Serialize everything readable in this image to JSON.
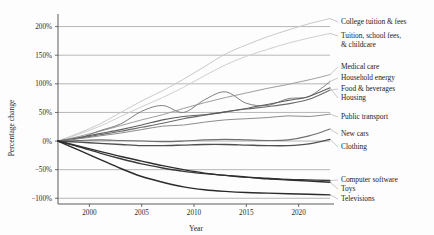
{
  "chart_data": {
    "type": "line",
    "title": "",
    "xlabel": "Year",
    "ylabel": "Percentage change",
    "xlim": [
      1997,
      2023
    ],
    "ylim": [
      -110,
      215
    ],
    "grid": true,
    "legend_position": "right-inline-labels",
    "xticks": [
      2000,
      2005,
      2010,
      2015,
      2020
    ],
    "xtick_labels": [
      "2000",
      "2005",
      "2010",
      "2015",
      "2020"
    ],
    "yticks": [
      -100,
      -50,
      0,
      50,
      100,
      150,
      200
    ],
    "ytick_labels": [
      "−100%",
      "−50%",
      "0%",
      "50%",
      "100%",
      "150%",
      "200%"
    ],
    "x": [
      1997,
      1999,
      2001,
      2003,
      2005,
      2007,
      2009,
      2011,
      2013,
      2015,
      2017,
      2019,
      2021,
      2023
    ],
    "series": [
      {
        "name": "College tuition & fees",
        "color": "#c9c9c9",
        "width": 1.0,
        "values": [
          0,
          14,
          30,
          50,
          70,
          88,
          108,
          130,
          152,
          168,
          182,
          194,
          205,
          214
        ]
      },
      {
        "name": "Tuition, school fees, & childcare",
        "color": "#cfcfcf",
        "width": 1.0,
        "values": [
          0,
          12,
          26,
          43,
          60,
          76,
          94,
          114,
          133,
          148,
          160,
          171,
          180,
          188
        ]
      },
      {
        "name": "Medical care",
        "color": "#9e9e9e",
        "width": 1.0,
        "values": [
          0,
          8,
          17,
          27,
          37,
          46,
          57,
          67,
          76,
          84,
          92,
          99,
          107,
          116
        ]
      },
      {
        "name": "Household energy",
        "color": "#7e7e7e",
        "width": 1.0,
        "values": [
          0,
          5,
          18,
          30,
          52,
          62,
          50,
          72,
          86,
          66,
          62,
          74,
          78,
          104
        ]
      },
      {
        "name": "Food & beverages",
        "color": "#6b6b6b",
        "width": 1.1,
        "values": [
          0,
          5,
          11,
          17,
          24,
          31,
          39,
          45,
          51,
          56,
          60,
          65,
          73,
          89
        ]
      },
      {
        "name": "Housing",
        "color": "#5d5d5d",
        "width": 1.1,
        "values": [
          0,
          6,
          13,
          20,
          28,
          37,
          43,
          46,
          51,
          57,
          64,
          71,
          78,
          93
        ]
      },
      {
        "name": "Public transport",
        "color": "#8c8c8c",
        "width": 1.0,
        "values": [
          0,
          4,
          9,
          14,
          20,
          26,
          28,
          33,
          37,
          39,
          41,
          44,
          43,
          47
        ]
      },
      {
        "name": "New cars",
        "color": "#6f6f6f",
        "width": 1.1,
        "values": [
          0,
          1,
          2,
          1,
          0,
          -1,
          0,
          2,
          3,
          2,
          1,
          2,
          9,
          21
        ]
      },
      {
        "name": "Clothing",
        "color": "#4f4f4f",
        "width": 1.3,
        "values": [
          0,
          -2,
          -4,
          -6,
          -8,
          -8,
          -7,
          -6,
          -6,
          -7,
          -8,
          -8,
          -5,
          3
        ]
      },
      {
        "name": "Computer software",
        "color": "#3a3a3a",
        "width": 1.4,
        "values": [
          0,
          -10,
          -21,
          -31,
          -40,
          -47,
          -53,
          -57,
          -60,
          -63,
          -65,
          -67,
          -68,
          -69
        ]
      },
      {
        "name": "Toys",
        "color": "#2e2e2e",
        "width": 1.4,
        "values": [
          0,
          -9,
          -18,
          -27,
          -35,
          -43,
          -50,
          -56,
          -60,
          -63,
          -66,
          -68,
          -70,
          -72
        ]
      },
      {
        "name": "Televisions",
        "color": "#2a2a2a",
        "width": 1.4,
        "values": [
          0,
          -16,
          -32,
          -48,
          -62,
          -72,
          -80,
          -85,
          -88,
          -90,
          -91,
          -92,
          -93,
          -94
        ]
      }
    ],
    "annotations": [
      {
        "text": "College tuition & fees",
        "y_at_label": 212
      },
      {
        "text": "Tuition, school fees,",
        "y_at_label": 186
      },
      {
        "text": "& childcare",
        "y_at_label": 170
      },
      {
        "text": "Medical care",
        "y_at_label": 116
      },
      {
        "text": "Household energy",
        "y_at_label": 101
      },
      {
        "text": "Food & beverages",
        "y_at_label": 88
      },
      {
        "text": "Housing",
        "y_at_label": 74
      },
      {
        "text": "Public transport",
        "y_at_label": 47
      },
      {
        "text": "New cars",
        "y_at_label": 21
      },
      {
        "text": "Clothing",
        "y_at_label": 3
      },
      {
        "text": "Computer software",
        "y_at_label": -69
      },
      {
        "text": "Toys",
        "y_at_label": -79
      },
      {
        "text": "Televisions",
        "y_at_label": -94
      }
    ]
  },
  "labels": {
    "y_axis_title": "Percentage change",
    "x_axis_title": "Year",
    "right_labels": [
      {
        "id": "college-tuition",
        "text": "College tuition & fees"
      },
      {
        "id": "tuition-school-fees",
        "text": "Tuition, school fees,"
      },
      {
        "id": "tuition-childcare",
        "text": "& childcare"
      },
      {
        "id": "medical-care",
        "text": "Medical care"
      },
      {
        "id": "household-energy",
        "text": "Household energy"
      },
      {
        "id": "food-beverages",
        "text": "Food & beverages"
      },
      {
        "id": "housing",
        "text": "Housing"
      },
      {
        "id": "public-transport",
        "text": "Public transport"
      },
      {
        "id": "new-cars",
        "text": "New cars"
      },
      {
        "id": "clothing",
        "text": "Clothing"
      },
      {
        "id": "computer-software",
        "text": "Computer software"
      },
      {
        "id": "toys",
        "text": "Toys"
      },
      {
        "id": "televisions",
        "text": "Televisions"
      }
    ],
    "ytick_labels": [
      "200%",
      "150%",
      "100%",
      "50%",
      "0%",
      "−50%",
      "−100%"
    ],
    "xtick_labels": [
      "2000",
      "2005",
      "2010",
      "2015",
      "2020"
    ]
  }
}
